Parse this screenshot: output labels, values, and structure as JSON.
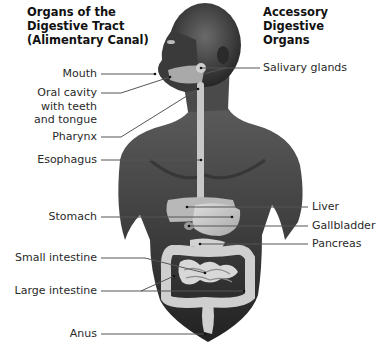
{
  "titles": {
    "left": "Organs of the\nDigestive Tract\n(Alimentary Canal)",
    "right": "Accessory Digestive\nOrgans"
  },
  "digestive_tract_labels": [
    {
      "id": "mouth",
      "text": "Mouth"
    },
    {
      "id": "oral-cavity",
      "text": "Oral cavity\nwith teeth\nand tongue"
    },
    {
      "id": "pharynx",
      "text": "Pharynx"
    },
    {
      "id": "esophagus",
      "text": "Esophagus"
    },
    {
      "id": "stomach",
      "text": "Stomach"
    },
    {
      "id": "small-intestine",
      "text": "Small intestine"
    },
    {
      "id": "large-intestine",
      "text": "Large intestine"
    },
    {
      "id": "anus",
      "text": "Anus"
    }
  ],
  "accessory_labels": [
    {
      "id": "salivary-glands",
      "text": "Salivary glands"
    },
    {
      "id": "liver",
      "text": "Liver"
    },
    {
      "id": "gallbladder",
      "text": "Gallbladder"
    },
    {
      "id": "pancreas",
      "text": "Pancreas"
    }
  ],
  "colors": {
    "skin_dark": "#2e2e2e",
    "skin_mid": "#5a5a5a",
    "organ_light": "#c9c9c9",
    "leader_line": "#555555",
    "background": "#ffffff"
  }
}
